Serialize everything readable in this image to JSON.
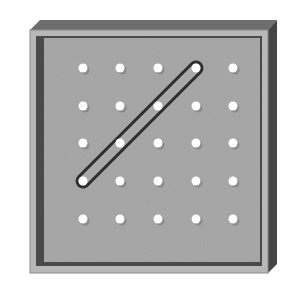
{
  "diagram": {
    "type": "geoboard",
    "grid": {
      "rows": 5,
      "cols": 5
    },
    "pegs": {
      "xs": [
        83,
        120,
        158,
        196,
        233
      ],
      "ys": [
        68,
        106,
        143,
        181,
        219
      ]
    },
    "rubber_band": {
      "from": {
        "col": 3,
        "row": 0
      },
      "to": {
        "col": 0,
        "row": 3
      },
      "description": "diagonal band stretched between two pegs"
    },
    "colors": {
      "background": "#ffffff",
      "board_face": "#a9a9a9",
      "board_frame": "#b8b8b8",
      "inner_border": "#4a4a4a",
      "bevel_top": "#6e6e6e",
      "side": "#444444",
      "peg": "#ffffff",
      "band": "#2e2e2e"
    }
  }
}
